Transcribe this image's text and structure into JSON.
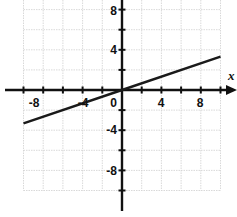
{
  "chart_data": {
    "type": "line",
    "title": "",
    "xlabel": "x",
    "ylabel": "",
    "xlim": [
      -10,
      10
    ],
    "ylim": [
      -10,
      10
    ],
    "grid": true,
    "grid_step": 2,
    "x_tick_labels": [
      "-8",
      "-4",
      "0",
      "4",
      "8"
    ],
    "y_tick_labels": [
      "8",
      "4",
      "-4",
      "-8"
    ],
    "origin_label": "0",
    "series": [
      {
        "name": "line",
        "equation": "y = x/3",
        "x": [
          -10,
          0,
          10
        ],
        "y": [
          -3.33,
          0,
          3.33
        ]
      }
    ],
    "colors": {
      "line": "#1a1a1a",
      "axis": "#111111",
      "grid": "#cfcfcf"
    }
  },
  "labels": {
    "x_axis_name": "x",
    "origin": "0",
    "x_ticks": [
      "-8",
      "-4",
      "4",
      "8"
    ],
    "y_ticks": [
      "8",
      "4",
      "-4",
      "-8"
    ]
  }
}
